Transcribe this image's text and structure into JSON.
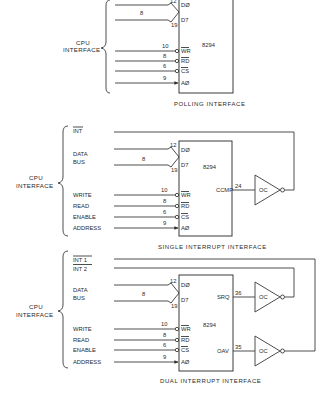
{
  "diagrams": [
    {
      "caption": "POLLING INTERFACE",
      "group_label_line1": "CPU",
      "group_label_line2": "INTERFACE",
      "chip": "8294",
      "bus": {
        "width_label": "8",
        "pin_d0": "12",
        "pin_d7": "19",
        "label_d0": "DØ",
        "label_d7": "D7"
      },
      "pins": [
        {
          "signal": "",
          "pin": "10",
          "name": "WR",
          "inverted": true
        },
        {
          "signal": "",
          "pin": "8",
          "name": "RD",
          "inverted": true
        },
        {
          "signal": "",
          "pin": "6",
          "name": "CS",
          "inverted": true
        },
        {
          "signal": "",
          "pin": "9",
          "name": "AØ",
          "inverted": false
        }
      ]
    },
    {
      "caption": "SINGLE INTERRUPT INTERFACE",
      "group_label_line1": "CPU",
      "group_label_line2": "INTERFACE",
      "chip": "8294",
      "interrupts": [
        "INT"
      ],
      "data_bus_label_1": "DATA",
      "data_bus_label_2": "BUS",
      "bus": {
        "width_label": "8",
        "pin_d0": "12",
        "pin_d7": "19",
        "label_d0": "DØ",
        "label_d7": "D7"
      },
      "pins": [
        {
          "signal": "WRITE",
          "pin": "10",
          "name": "WR",
          "inverted": true
        },
        {
          "signal": "READ",
          "pin": "8",
          "name": "RD",
          "inverted": true
        },
        {
          "signal": "ENABLE",
          "pin": "6",
          "name": "CS",
          "inverted": true
        },
        {
          "signal": "ADDRESS",
          "pin": "9",
          "name": "AØ",
          "inverted": false
        }
      ],
      "outputs": [
        {
          "name": "CCMP",
          "pin": "24",
          "buffer": "OC"
        }
      ]
    },
    {
      "caption": "DUAL INTERRUPT INTERFACE",
      "group_label_line1": "CPU",
      "group_label_line2": "INTERFACE",
      "chip": "8294",
      "interrupts": [
        "INT 1",
        "INT 2"
      ],
      "data_bus_label_1": "DATA",
      "data_bus_label_2": "BUS",
      "bus": {
        "width_label": "8",
        "pin_d0": "12",
        "pin_d7": "19",
        "label_d0": "DØ",
        "label_d7": "D7"
      },
      "pins": [
        {
          "signal": "WRITE",
          "pin": "10",
          "name": "WR",
          "inverted": true
        },
        {
          "signal": "READ",
          "pin": "8",
          "name": "RD",
          "inverted": true
        },
        {
          "signal": "ENABLE",
          "pin": "6",
          "name": "CS",
          "inverted": true
        },
        {
          "signal": "ADDRESS",
          "pin": "9",
          "name": "AØ",
          "inverted": false
        }
      ],
      "outputs": [
        {
          "name": "SRQ",
          "pin": "36",
          "buffer": "OC"
        },
        {
          "name": "OAV",
          "pin": "35",
          "buffer": "OC"
        }
      ]
    }
  ]
}
